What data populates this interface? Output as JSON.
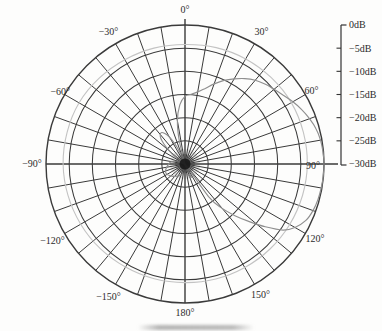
{
  "figure": {
    "kind": "antenna radiation pattern polar plot",
    "background": "#fdfdfc"
  },
  "colors": {
    "grid": "#3a3a3a",
    "axis": "#333333",
    "text": "#2b2b2b",
    "main_pattern": "#8f8f8f",
    "reference_pattern": "#c3c3c3",
    "center_blob": "#1a1a1a"
  },
  "chart_data": {
    "type": "line",
    "subtype": "polar",
    "title": "",
    "angular_axis": {
      "unit": "deg",
      "spoke_step_deg": 10,
      "zero_at": "top",
      "clockwise": true,
      "labels": [
        {
          "angle": 0,
          "text": "0°"
        },
        {
          "angle": 30,
          "text": "30°"
        },
        {
          "angle": 60,
          "text": "60°"
        },
        {
          "angle": 90,
          "text": "90°"
        },
        {
          "angle": 120,
          "text": "120°"
        },
        {
          "angle": 150,
          "text": "150°"
        },
        {
          "angle": 180,
          "text": "180°"
        },
        {
          "angle": -30,
          "text": "−30°"
        },
        {
          "angle": -60,
          "text": "−60°"
        },
        {
          "angle": -90,
          "text": "−90°"
        },
        {
          "angle": -120,
          "text": "−120°"
        },
        {
          "angle": -150,
          "text": "−150°"
        }
      ]
    },
    "radial_axis": {
      "unit": "dB",
      "min": -30,
      "max": 0,
      "step": 5,
      "tick_labels": [
        "0dB",
        "−5dB",
        "−10dB",
        "−15dB",
        "−20dB",
        "−25dB",
        "−30dB"
      ],
      "legend_position": "right"
    },
    "grid": {
      "rings": 6,
      "spokes": 36
    },
    "series": [
      {
        "name": "reference-pattern",
        "color": "#c3c3c3",
        "width": 1.1,
        "points": [
          [
            -180,
            -4.4
          ],
          [
            -165,
            -4.35
          ],
          [
            -150,
            -4.3
          ],
          [
            -135,
            -4.15
          ],
          [
            -120,
            -4.0
          ],
          [
            -105,
            -3.85
          ],
          [
            -90,
            -3.7
          ],
          [
            -75,
            -3.65
          ],
          [
            -60,
            -3.6
          ],
          [
            -45,
            -3.8
          ],
          [
            -30,
            -4.0
          ],
          [
            -15,
            -4.1
          ],
          [
            0,
            -4.2
          ],
          [
            15,
            -4.0
          ],
          [
            30,
            -3.8
          ],
          [
            45,
            -3.65
          ],
          [
            60,
            -3.5
          ],
          [
            75,
            -3.55
          ],
          [
            90,
            -3.6
          ],
          [
            105,
            -3.75
          ],
          [
            120,
            -3.9
          ],
          [
            135,
            -4.05
          ],
          [
            150,
            -4.2
          ],
          [
            165,
            -4.3
          ]
        ]
      },
      {
        "name": "main-pattern",
        "color": "#8f8f8f",
        "width": 1.15,
        "points": [
          [
            -180,
            -28
          ],
          [
            -170,
            -28
          ],
          [
            -160,
            -27.5
          ],
          [
            -150,
            -27
          ],
          [
            -140,
            -26.5
          ],
          [
            -130,
            -26
          ],
          [
            -120,
            -25.5
          ],
          [
            -110,
            -25.5
          ],
          [
            -100,
            -26
          ],
          [
            -90,
            -26.5
          ],
          [
            -80,
            -27
          ],
          [
            -70,
            -28.5
          ],
          [
            -60,
            -30
          ],
          [
            -52,
            -26.5
          ],
          [
            -45,
            -23
          ],
          [
            -38,
            -21.5
          ],
          [
            -32,
            -22.5
          ],
          [
            -27,
            -25
          ],
          [
            -22,
            -28
          ],
          [
            -18,
            -30
          ],
          [
            -14,
            -25
          ],
          [
            -10,
            -20.5
          ],
          [
            -5,
            -17.2
          ],
          [
            0,
            -15.4
          ],
          [
            5,
            -14.9
          ],
          [
            10,
            -14.2
          ],
          [
            15,
            -13.1
          ],
          [
            20,
            -11.6
          ],
          [
            25,
            -10.1
          ],
          [
            30,
            -8.8
          ],
          [
            35,
            -7.5
          ],
          [
            40,
            -6.4
          ],
          [
            45,
            -5.6
          ],
          [
            50,
            -4.9
          ],
          [
            55,
            -4.1
          ],
          [
            60,
            -3.1
          ],
          [
            65,
            -2.2
          ],
          [
            70,
            -1.4
          ],
          [
            75,
            -0.7
          ],
          [
            80,
            -0.3
          ],
          [
            85,
            -0.1
          ],
          [
            90,
            0
          ],
          [
            95,
            -0.05
          ],
          [
            100,
            -0.15
          ],
          [
            105,
            -0.3
          ],
          [
            110,
            -0.6
          ],
          [
            115,
            -1.2
          ],
          [
            120,
            -2.6
          ],
          [
            124,
            -4.5
          ],
          [
            128,
            -8
          ],
          [
            132,
            -11.5
          ],
          [
            136,
            -14.5
          ],
          [
            140,
            -17.5
          ],
          [
            144,
            -21
          ],
          [
            148,
            -30
          ],
          [
            154,
            -27
          ],
          [
            160,
            -27.2
          ],
          [
            170,
            -27.8
          ],
          [
            180,
            -28
          ]
        ]
      }
    ]
  }
}
